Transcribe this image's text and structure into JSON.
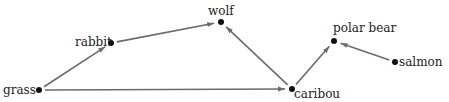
{
  "diagram": {
    "type": "food-web",
    "nodes": [
      {
        "id": "grass",
        "label": "grass",
        "x": 39,
        "y": 90,
        "lx": 3,
        "ly": 94,
        "anchor": "start"
      },
      {
        "id": "rabbit",
        "label": "rabbit",
        "x": 111,
        "y": 43,
        "lx": 75,
        "ly": 46,
        "anchor": "start"
      },
      {
        "id": "wolf",
        "label": "wolf",
        "x": 221,
        "y": 22,
        "lx": 208,
        "ly": 15,
        "anchor": "start"
      },
      {
        "id": "caribou",
        "label": "caribou",
        "x": 292,
        "y": 89,
        "lx": 294,
        "ly": 98,
        "anchor": "start"
      },
      {
        "id": "polar_bear",
        "label": "polar bear",
        "x": 334,
        "y": 41,
        "lx": 333,
        "ly": 32,
        "anchor": "start"
      },
      {
        "id": "salmon",
        "label": "salmon",
        "x": 395,
        "y": 62,
        "lx": 399,
        "ly": 66,
        "anchor": "start"
      }
    ],
    "edges": [
      {
        "from": "grass",
        "to": "rabbit"
      },
      {
        "from": "rabbit",
        "to": "wolf"
      },
      {
        "from": "grass",
        "to": "caribou"
      },
      {
        "from": "caribou",
        "to": "wolf"
      },
      {
        "from": "caribou",
        "to": "polar_bear"
      },
      {
        "from": "salmon",
        "to": "polar_bear"
      }
    ],
    "colors": {
      "edge": "#6b6b6b",
      "node": "#111111",
      "text": "#222222"
    }
  }
}
